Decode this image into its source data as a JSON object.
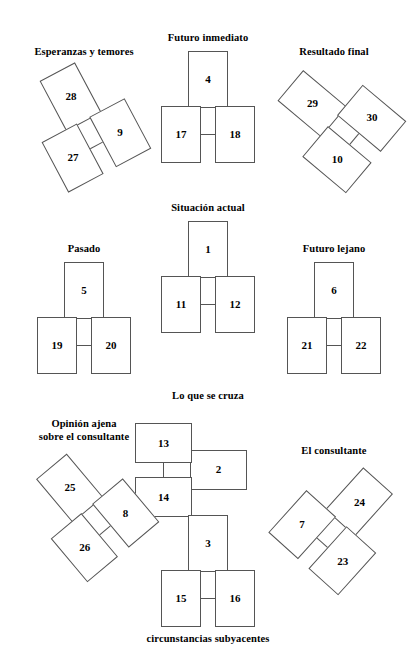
{
  "document": {
    "title": "Tirada de tarot - esquema de posiciones",
    "language": "es"
  },
  "spread": {
    "groups": [
      {
        "id": "esperanzas",
        "label": "Esperanzas y temores",
        "label_position": "above",
        "rotation_deg": -28,
        "cards": {
          "top": "28",
          "left": "27",
          "right": "9"
        }
      },
      {
        "id": "futuro-inmediato",
        "label": "Futuro inmediato",
        "label_position": "above",
        "rotation_deg": 0,
        "cards": {
          "top": "4",
          "left": "17",
          "right": "18"
        }
      },
      {
        "id": "resultado-final",
        "label": "Resultado final",
        "label_position": "above",
        "rotation_deg": -50,
        "cards": {
          "top": "29",
          "left": "10",
          "right": "30"
        }
      },
      {
        "id": "pasado",
        "label": "Pasado",
        "label_position": "above",
        "rotation_deg": 0,
        "cards": {
          "top": "5",
          "left": "19",
          "right": "20"
        }
      },
      {
        "id": "situacion-actual",
        "label": "Situación actual",
        "label_position": "above",
        "rotation_deg": 0,
        "cards": {
          "top": "1",
          "left": "11",
          "right": "12"
        }
      },
      {
        "id": "futuro-lejano",
        "label": "Futuro lejano",
        "label_position": "above",
        "rotation_deg": 0,
        "cards": {
          "top": "6",
          "left": "21",
          "right": "22"
        }
      },
      {
        "id": "lo-que-se-cruza",
        "label": "Lo que se cruza",
        "label_position": "above",
        "rotation_deg": 90,
        "cards": {
          "top": "2",
          "left": "13",
          "right": "14"
        }
      },
      {
        "id": "opinion-ajena",
        "label": "Opinión ajena sobre el consultante",
        "label_line_1": "Opinión ajena",
        "label_line_2": "sobre el consultante",
        "label_position": "above",
        "rotation_deg": -40,
        "cards": {
          "top": "25",
          "left": "26",
          "right": "8"
        }
      },
      {
        "id": "el-consultante",
        "label": "El consultante",
        "label_position": "above",
        "rotation_deg": 42,
        "cards": {
          "top": "24",
          "left": "7",
          "right": "23"
        }
      },
      {
        "id": "circunstancias-subyacentes",
        "label": "circunstancias subyacentes",
        "label_position": "below",
        "rotation_deg": 0,
        "cards": {
          "top": "3",
          "left": "15",
          "right": "16"
        }
      }
    ]
  },
  "style": {
    "card_border_color": "#555555",
    "card_fill_color": "#ffffff",
    "text_color": "#000000",
    "background_color": "#ffffff"
  }
}
